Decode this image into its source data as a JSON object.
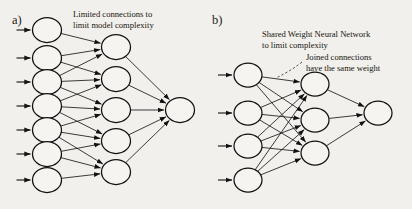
{
  "figure": {
    "background_color": "#f2f0ec",
    "ink_color": "#111111",
    "width": 412,
    "height": 209
  },
  "panels": [
    {
      "id": "a",
      "label": "a)",
      "annotations": [
        {
          "id": "limited-connections",
          "line1": "Limited connections to",
          "line2": "limit model complexity"
        }
      ],
      "network": {
        "input_nodes": 7,
        "hidden_nodes": 5,
        "output_nodes": 1,
        "connectivity": "sparse-sliding-window",
        "window_size": 3,
        "hidden_to_output": "full"
      }
    },
    {
      "id": "b",
      "label": "b)",
      "annotations": [
        {
          "id": "shared-weight",
          "line1": "Shared Weight Neural Network",
          "line2": "to limit complexity"
        },
        {
          "id": "joined-connections",
          "line1": "Joined connections",
          "line2": "have the same weight"
        }
      ],
      "network": {
        "input_nodes": 4,
        "hidden_nodes": 3,
        "output_nodes": 1,
        "connectivity": "fully-connected",
        "hidden_to_output": "full"
      }
    }
  ],
  "chart_data": {
    "type": "diagram",
    "subtype": "neural-network-architecture",
    "panels": [
      {
        "panel": "a",
        "caption": "Limited connections to limit model complexity",
        "layers": [
          {
            "name": "input",
            "count": 7,
            "x": 47,
            "ys": [
              30,
              58,
              82,
              106,
              130,
              154,
              180
            ]
          },
          {
            "name": "hidden",
            "count": 5,
            "x": 116,
            "ys": [
              47,
              79,
              110,
              141,
              172
            ]
          },
          {
            "name": "output",
            "count": 1,
            "x": 180,
            "ys": [
              110
            ]
          }
        ],
        "edges_input_to_hidden": [
          [
            0,
            1,
            2
          ],
          [
            1,
            2,
            3
          ],
          [
            2,
            3,
            4
          ],
          [
            3,
            4,
            5
          ],
          [
            4,
            5,
            6
          ]
        ],
        "edges_hidden_to_output": [
          0,
          1,
          2,
          3,
          4
        ]
      },
      {
        "panel": "b",
        "caption": "Shared Weight Neural Network to limit complexity; joined connections have the same weight",
        "layers": [
          {
            "name": "input",
            "count": 4,
            "x": 248,
            "ys": [
              75,
              113,
              146,
              180
            ]
          },
          {
            "name": "hidden",
            "count": 3,
            "x": 315,
            "ys": [
              84,
              120,
              153
            ]
          },
          {
            "name": "output",
            "count": 1,
            "x": 378,
            "ys": [
              113
            ]
          }
        ],
        "edges_input_to_hidden": "all-pairs",
        "edges_hidden_to_output": [
          0,
          1,
          2
        ]
      }
    ]
  }
}
